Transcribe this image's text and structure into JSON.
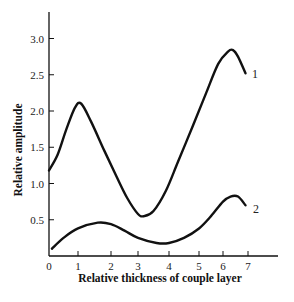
{
  "chart_data": {
    "type": "line",
    "title": "",
    "xlabel": "Relative thickness of couple layer",
    "ylabel": "Relative amplitude",
    "xlim": [
      0,
      7.8
    ],
    "ylim": [
      0,
      3.4
    ],
    "grid": false,
    "legend": "curve labels at line ends",
    "x_ticks": [
      "0",
      "1",
      "2",
      "3",
      "4",
      "5",
      "6",
      "7"
    ],
    "y_ticks": [
      "0.5",
      "1.0",
      "1.5",
      "2.0",
      "2.5",
      "3.0"
    ],
    "series": [
      {
        "name": "1",
        "x": [
          0,
          0.3,
          0.6,
          0.9,
          1.1,
          1.4,
          1.8,
          2.2,
          2.6,
          3.0,
          3.2,
          3.5,
          3.9,
          4.3,
          4.8,
          5.3,
          5.8,
          6.2,
          6.4,
          6.6,
          6.9
        ],
        "values": [
          1.18,
          1.4,
          1.75,
          2.05,
          2.1,
          1.85,
          1.45,
          1.1,
          0.8,
          0.58,
          0.55,
          0.62,
          0.9,
          1.3,
          1.8,
          2.25,
          2.65,
          2.82,
          2.84,
          2.75,
          2.52
        ]
      },
      {
        "name": "2",
        "x": [
          0.1,
          0.5,
          1.0,
          1.6,
          2.0,
          2.5,
          3.0,
          3.6,
          4.0,
          4.5,
          5.0,
          5.5,
          6.0,
          6.3,
          6.6,
          6.9
        ],
        "values": [
          0.1,
          0.25,
          0.38,
          0.46,
          0.44,
          0.35,
          0.25,
          0.18,
          0.18,
          0.25,
          0.38,
          0.55,
          0.75,
          0.82,
          0.82,
          0.7
        ]
      }
    ]
  },
  "labels": {
    "curve1": "1",
    "curve2": "2"
  }
}
